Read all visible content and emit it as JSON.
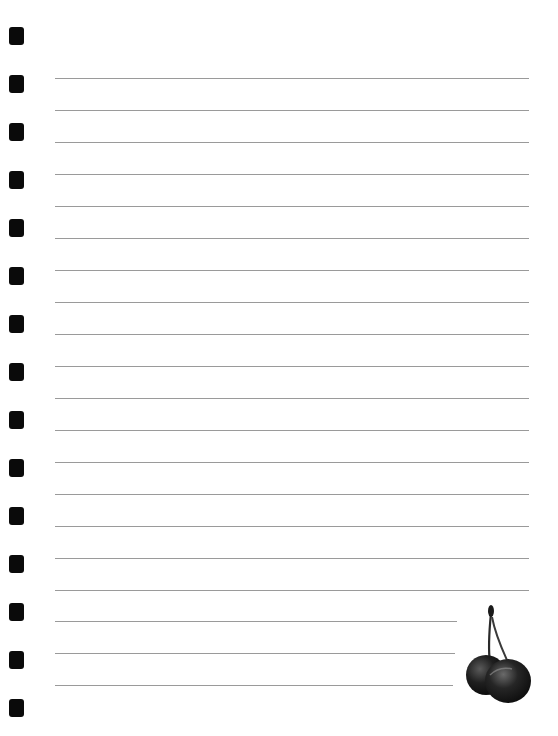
{
  "page": {
    "type": "lined-notebook-paper",
    "background": "#ffffff",
    "line_color": "#9a9a9a",
    "hole_color": "#0a0a0a"
  },
  "binding_holes": {
    "count": 15,
    "tops": [
      27,
      75,
      123,
      171,
      219,
      267,
      315,
      363,
      411,
      459,
      507,
      555,
      603,
      651,
      699
    ]
  },
  "rules": {
    "lines": [
      {
        "y": 78,
        "right": 529
      },
      {
        "y": 110,
        "right": 529
      },
      {
        "y": 142,
        "right": 529
      },
      {
        "y": 174,
        "right": 529
      },
      {
        "y": 206,
        "right": 529
      },
      {
        "y": 238,
        "right": 529
      },
      {
        "y": 270,
        "right": 529
      },
      {
        "y": 302,
        "right": 529
      },
      {
        "y": 334,
        "right": 529
      },
      {
        "y": 366,
        "right": 529
      },
      {
        "y": 398,
        "right": 529
      },
      {
        "y": 430,
        "right": 529
      },
      {
        "y": 462,
        "right": 529
      },
      {
        "y": 494,
        "right": 529
      },
      {
        "y": 526,
        "right": 529
      },
      {
        "y": 558,
        "right": 529
      },
      {
        "y": 590,
        "right": 529
      },
      {
        "y": 621,
        "right": 457
      },
      {
        "y": 653,
        "right": 455
      },
      {
        "y": 685,
        "right": 453
      }
    ]
  },
  "decoration": {
    "icon": "cherry-pair-icon"
  }
}
